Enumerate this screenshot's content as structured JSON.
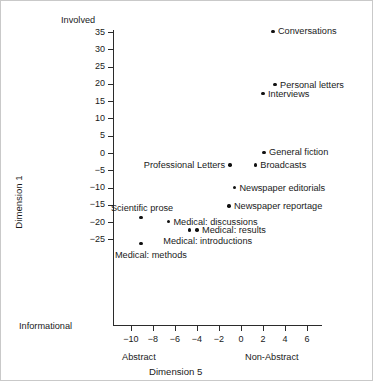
{
  "chart_data": {
    "type": "scatter",
    "title": "",
    "xlabel": "Dimension 5",
    "ylabel": "Dimension 1",
    "xlim": [
      -11.5,
      7.4
    ],
    "ylim": [
      -28.5,
      36.5
    ],
    "grid": false,
    "legend": null,
    "axis_end_labels": {
      "y_top": "Involved",
      "y_bottom": "Informational",
      "x_left": "Abstract",
      "x_right": "Non-Abstract"
    },
    "xticks": [
      -10,
      -8,
      -6,
      -4,
      -2,
      0,
      2,
      4,
      6
    ],
    "xtick_labels": [
      "-10",
      "-8",
      "-6",
      "-4",
      "-2",
      "0",
      "2",
      "4",
      "6"
    ],
    "yticks": [
      35,
      30,
      25,
      20,
      15,
      10,
      5,
      0,
      -5,
      -10,
      -15,
      -20,
      -25
    ],
    "ytick_labels": [
      "35",
      "30",
      "25",
      "20",
      "15",
      "10",
      "5",
      "0",
      "-5",
      "-10",
      "-15",
      "-20",
      "-25"
    ],
    "points": [
      {
        "label": "Conversations",
        "x": 2.9,
        "y": 35.2,
        "label_side": "right"
      },
      {
        "label": "Personal letters",
        "x": 3.1,
        "y": 19.8,
        "label_side": "right"
      },
      {
        "label": "Interviews",
        "x": 2.0,
        "y": 17.2,
        "label_side": "right"
      },
      {
        "label": "General fiction",
        "x": 2.1,
        "y": 0.2,
        "label_side": "right"
      },
      {
        "label": "Broadcasts",
        "x": 1.3,
        "y": -3.5,
        "label_side": "right"
      },
      {
        "label": "Professional Letters",
        "x": -1.0,
        "y": -3.5,
        "label_side": "left"
      },
      {
        "label": "Newspaper editorials",
        "x": -0.6,
        "y": -10.0,
        "label_side": "right"
      },
      {
        "label": "Newspaper reportage",
        "x": -1.1,
        "y": -15.3,
        "label_side": "right"
      },
      {
        "label": "Scientific prose",
        "x": -9.1,
        "y": -18.7,
        "label_side": "above"
      },
      {
        "label": "Medical: discussions",
        "x": -6.6,
        "y": -19.9,
        "label_side": "right"
      },
      {
        "label": "Medical: results",
        "x": -4.0,
        "y": -22.3,
        "label_side": "right"
      },
      {
        "label": "Medical: introductions",
        "x": -4.7,
        "y": -22.3,
        "label_side": "below"
      },
      {
        "label": "Medical: methods",
        "x": -9.1,
        "y": -26.2,
        "label_side": "below"
      }
    ]
  }
}
